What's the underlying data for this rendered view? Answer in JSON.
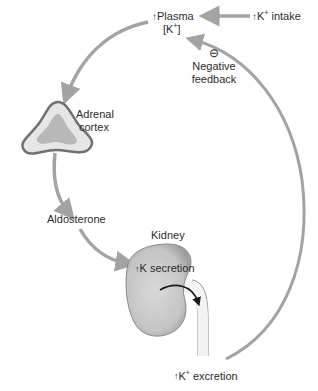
{
  "colors": {
    "arrow": "#a3a3a3",
    "adrenal_outer": "#707070",
    "adrenal_fill": "#e6e6e6",
    "adrenal_inner": "#b8b8b8",
    "kidney_fill": "#c9c9c9",
    "kidney_edge": "#8a8a8a",
    "black_arrow": "#1a1a1a"
  },
  "nodes": {
    "plasma": {
      "line1": "Plasma",
      "line2": "[K",
      "sup": "+",
      "close": "]",
      "direction": "increase"
    },
    "intake": {
      "text": "K",
      "sup": "+",
      "rest": " intake",
      "direction": "increase"
    },
    "feedback": {
      "sign": "−",
      "line1": "Negative",
      "line2": "feedback"
    },
    "adrenal": {
      "line1": "Adrenal",
      "line2": "cortex"
    },
    "aldosterone": {
      "text": "Aldosterone"
    },
    "kidney": {
      "label": "Kidney",
      "secretion": "K secretion",
      "direction": "increase"
    },
    "excretion": {
      "text": "K",
      "sup": "+",
      "rest": " excretion",
      "direction": "increase"
    }
  },
  "icons": {
    "up_arrow": "↑",
    "minus_circle": "⊖"
  },
  "edges": [
    {
      "from": "intake",
      "to": "plasma"
    },
    {
      "from": "plasma",
      "to": "adrenal"
    },
    {
      "from": "adrenal",
      "to": "aldosterone"
    },
    {
      "from": "aldosterone",
      "to": "kidney"
    },
    {
      "from": "excretion",
      "to": "plasma",
      "label": "Negative feedback"
    }
  ]
}
